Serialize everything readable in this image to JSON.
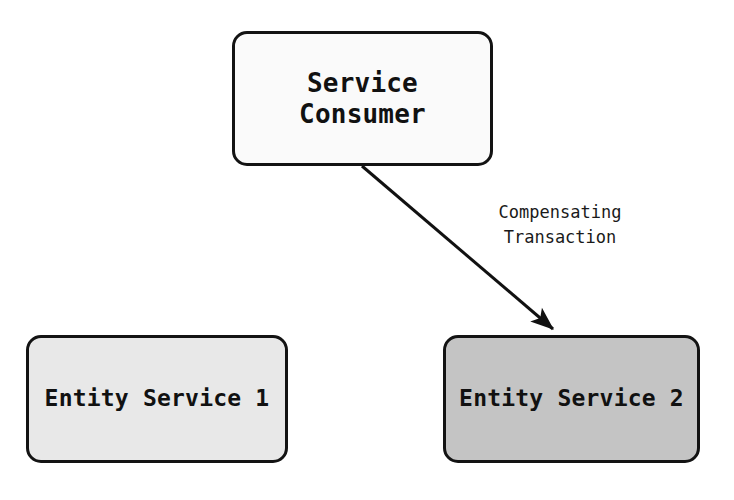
{
  "diagram": {
    "canvas": {
      "width": 734,
      "height": 500,
      "background": "#ffffff"
    },
    "nodes": [
      {
        "id": "service-consumer",
        "label": "Service\nConsumer",
        "label_line_1": "Service",
        "label_line_2": "Consumer",
        "shape": "rounded-rectangle",
        "fill": "#fafafa",
        "stroke": "#131313",
        "x": 232,
        "y": 31,
        "width": 261,
        "height": 135
      },
      {
        "id": "entity-service-1",
        "label": "Entity Service 1",
        "shape": "rounded-rectangle",
        "fill": "#e8e8e8",
        "stroke": "#131313",
        "x": 26,
        "y": 335,
        "width": 262,
        "height": 128
      },
      {
        "id": "entity-service-2",
        "label": "Entity Service 2",
        "shape": "rounded-rectangle",
        "fill": "#c4c4c4",
        "stroke": "#131313",
        "x": 443,
        "y": 335,
        "width": 257,
        "height": 128
      }
    ],
    "edges": [
      {
        "id": "compensating-transaction-arrow",
        "from": "service-consumer",
        "to": "entity-service-2",
        "label": "Compensating\nTransaction",
        "label_line_1": "Compensating",
        "label_line_2": "Transaction",
        "style": "solid",
        "arrowhead": "filled-triangle",
        "stroke": "#111111",
        "stroke_width": 3,
        "start_x": 362,
        "start_y": 166,
        "end_x": 558,
        "end_y": 333
      }
    ]
  }
}
